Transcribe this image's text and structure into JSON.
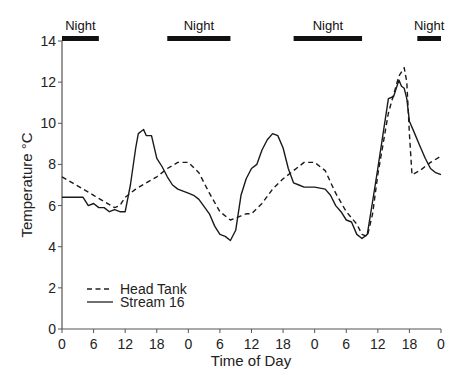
{
  "chart_data": {
    "type": "line",
    "title": "",
    "xlabel": "Time of Day",
    "ylabel": "Temperature °C",
    "xlim": [
      0,
      72
    ],
    "ylim": [
      0,
      14
    ],
    "x_ticks": [
      0,
      6,
      12,
      18,
      24,
      30,
      36,
      42,
      48,
      54,
      60,
      66,
      72
    ],
    "x_tick_labels": [
      "0",
      "6",
      "12",
      "18",
      "0",
      "6",
      "12",
      "18",
      "0",
      "6",
      "12",
      "18",
      "0"
    ],
    "y_ticks": [
      0,
      2,
      4,
      6,
      8,
      10,
      12,
      14
    ],
    "y_tick_labels": [
      "0",
      "2",
      "4",
      "6",
      "8",
      "10",
      "12",
      "14"
    ],
    "grid": false,
    "legend_position": "lower left",
    "night_periods": [
      {
        "label": "Night",
        "start": 0,
        "end": 7
      },
      {
        "label": "Night",
        "start": 20,
        "end": 32
      },
      {
        "label": "Night",
        "start": 44,
        "end": 57
      },
      {
        "label": "Night",
        "start": 67.5,
        "end": 72
      }
    ],
    "series": [
      {
        "name": "Head Tank",
        "style": "dashed",
        "x": [
          0,
          2,
          4,
          6,
          8,
          10,
          11,
          12,
          14,
          16,
          18,
          20,
          22,
          24,
          26,
          28,
          30,
          32,
          34,
          35,
          36,
          38,
          40,
          42,
          44,
          46,
          48,
          50,
          52,
          54,
          56,
          57,
          58,
          59,
          60,
          62,
          64,
          65,
          65.5,
          66,
          66.5,
          68,
          70,
          72
        ],
        "y": [
          7.4,
          7.1,
          6.8,
          6.5,
          6.2,
          5.9,
          6.0,
          6.4,
          6.8,
          7.1,
          7.4,
          7.8,
          8.1,
          8.1,
          7.6,
          6.6,
          5.7,
          5.3,
          5.5,
          5.6,
          5.6,
          6.1,
          6.8,
          7.3,
          7.7,
          8.1,
          8.1,
          7.7,
          6.6,
          5.7,
          5.1,
          4.6,
          4.5,
          5.6,
          7.5,
          10.5,
          12.3,
          12.7,
          12.0,
          9.5,
          7.5,
          7.7,
          8.1,
          8.4
        ]
      },
      {
        "name": "Stream 16",
        "style": "solid",
        "x": [
          0,
          2,
          4,
          5,
          6,
          7,
          8,
          9,
          10,
          11,
          12,
          13,
          14,
          14.5,
          15,
          15.5,
          16,
          17,
          18,
          19,
          20,
          21,
          22,
          24,
          25,
          26,
          28,
          29,
          30,
          31,
          32,
          33,
          34,
          35,
          36,
          37,
          38,
          39,
          40,
          41,
          42,
          43,
          44,
          45,
          46,
          48,
          50,
          51,
          52,
          53,
          54,
          55,
          56,
          57,
          58,
          59,
          60,
          61,
          62,
          63,
          64,
          64.5,
          65,
          65.5,
          66,
          67,
          68,
          69,
          70,
          71,
          72
        ],
        "y": [
          6.4,
          6.4,
          6.4,
          6.0,
          6.1,
          5.9,
          5.9,
          5.7,
          5.8,
          5.7,
          5.7,
          7.0,
          8.8,
          9.5,
          9.6,
          9.7,
          9.4,
          9.4,
          8.3,
          7.9,
          7.4,
          7.0,
          6.8,
          6.6,
          6.5,
          6.3,
          5.6,
          5.0,
          4.6,
          4.5,
          4.3,
          4.8,
          6.5,
          7.3,
          7.8,
          8.0,
          8.7,
          9.2,
          9.5,
          9.4,
          8.8,
          7.8,
          7.1,
          7.0,
          6.9,
          6.9,
          6.8,
          6.5,
          6.0,
          5.7,
          5.3,
          5.2,
          4.6,
          4.4,
          4.6,
          6.2,
          7.8,
          9.5,
          11.2,
          11.3,
          12.1,
          11.8,
          11.7,
          11.2,
          10.1,
          9.5,
          8.9,
          8.3,
          7.8,
          7.6,
          7.5
        ]
      }
    ]
  },
  "labels": {
    "xlabel": "Time of Day",
    "ylabel": "Temperature °C",
    "night": "Night",
    "legend_head_tank": "Head Tank",
    "legend_stream": "Stream 16"
  }
}
